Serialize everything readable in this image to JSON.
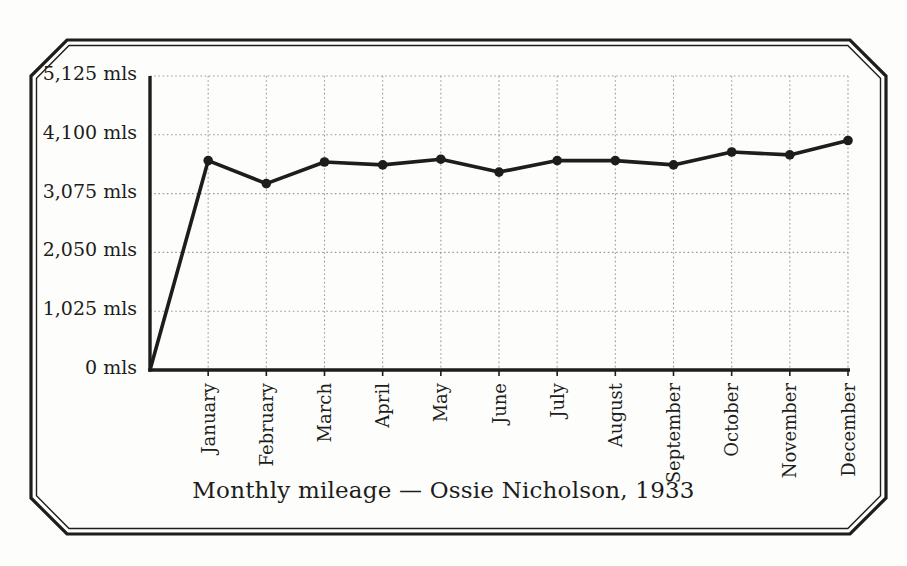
{
  "chart_data": {
    "type": "line",
    "title": "Monthly mileage — Ossie Nicholson, 1933",
    "categories": [
      "January",
      "February",
      "March",
      "April",
      "May",
      "June",
      "July",
      "August",
      "September",
      "October",
      "November",
      "December"
    ],
    "values": [
      3650,
      3250,
      3625,
      3575,
      3675,
      3450,
      3650,
      3650,
      3575,
      3800,
      3750,
      4000
    ],
    "unit": "mls",
    "y_ticks": [
      {
        "value": 0,
        "label": "0 mls"
      },
      {
        "value": 1025,
        "label": "1,025 mls"
      },
      {
        "value": 2050,
        "label": "2,050 mls"
      },
      {
        "value": 3075,
        "label": "3,075 mls"
      },
      {
        "value": 4100,
        "label": "4,100 mls"
      },
      {
        "value": 5125,
        "label": "5,125 mls"
      }
    ],
    "ylim": [
      0,
      5125
    ],
    "xlabel": "",
    "ylabel": "",
    "grid": "dotted",
    "legend": "none",
    "line_starts_at_origin": true,
    "marker": "filled-circle",
    "ink_color": "#1d1d1b",
    "grid_color": "#9b9b97"
  },
  "frame": {
    "color": "#1d1d1b"
  }
}
